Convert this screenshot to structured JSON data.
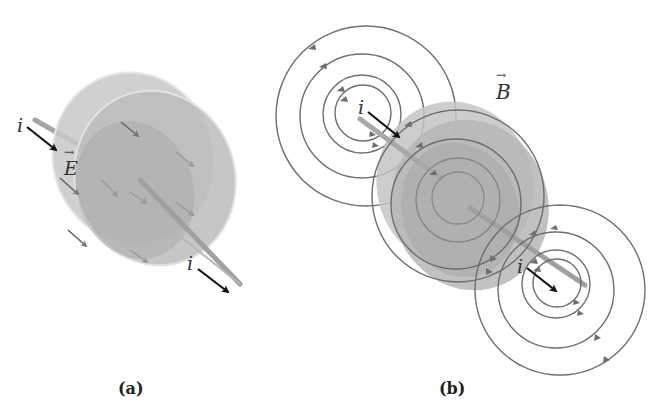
{
  "figure": {
    "panels": [
      {
        "id": "a",
        "caption": "(a)",
        "description": "Parallel-plate capacitor being charged by current i; electric field E between plates",
        "labels": {
          "current_in": "i",
          "current_out": "i",
          "electric_field": "E"
        }
      },
      {
        "id": "b",
        "caption": "(b)",
        "description": "Magnetic field lines B circling the wires and the region between the capacitor plates",
        "labels": {
          "current_in": "i",
          "current_out": "i",
          "magnetic_field": "B"
        }
      }
    ],
    "colors": {
      "field_line": "#6a6a6a",
      "plate_fill": "#bdbdbd",
      "plate_fill_dark": "#a8a8a8",
      "wire": "#a0a0a0",
      "current_arrow": "#111111",
      "text": "#333333"
    }
  }
}
